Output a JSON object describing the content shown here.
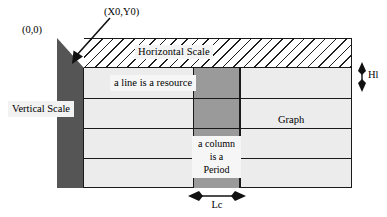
{
  "diagram": {
    "title_annotations": {
      "origin": "(0,0)",
      "start_point": "(X0,Y0)"
    },
    "bands": {
      "horizontal_scale": "Horizontal Scale",
      "vertical_scale": "Vertical Scale"
    },
    "cells": {
      "line_note": "a line is a resource",
      "graph": "Graph",
      "period_note_line1": "a column",
      "period_note_line2": "is a",
      "period_note_line3": "Period"
    },
    "measures": {
      "height_label": "Hl",
      "width_label": "Lc"
    },
    "colors": {
      "outline": "#1a1a1a",
      "vertical_scale_fill": "#555556",
      "period_column_fill": "#9a9a9b",
      "grid_fill": "#ececed",
      "hatch_fill": "#ffffff"
    },
    "grid": {
      "row_line_tops": [
        98,
        128,
        158
      ],
      "column_line_lefts": [
        240
      ]
    }
  }
}
